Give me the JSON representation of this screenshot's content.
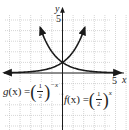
{
  "chart_data": {
    "type": "line",
    "title": "",
    "xlabel": "x",
    "ylabel": "y",
    "xlim": [
      -5,
      5
    ],
    "ylim": [
      -5,
      5
    ],
    "x_tick_labels": [
      "5"
    ],
    "y_tick_labels": [
      "5"
    ],
    "grid": true,
    "series": [
      {
        "name": "g(x) = (1/2)^(-x)",
        "formula": "2^x",
        "x": [
          -5,
          -4,
          -3,
          -2,
          -1,
          0,
          1,
          2
        ],
        "values": [
          0.03125,
          0.0625,
          0.125,
          0.25,
          0.5,
          1,
          2,
          4
        ]
      },
      {
        "name": "f(x) = (1/2)^x",
        "formula": "2^(-x)",
        "x": [
          -2,
          -1,
          0,
          1,
          2,
          3,
          4,
          5
        ],
        "values": [
          4,
          2,
          1,
          0.5,
          0.25,
          0.125,
          0.0625,
          0.03125
        ]
      }
    ],
    "annotations": [
      {
        "text": "g(x) = (1/2)^(-x)",
        "position": "lower-left"
      },
      {
        "text": "f(x) = (1/2)^x",
        "position": "lower-right"
      }
    ]
  },
  "labels": {
    "x_axis": "x",
    "y_axis": "y",
    "x_tick": "5",
    "y_tick": "5",
    "g_name": "g",
    "g_arg": "(x) =",
    "g_num": "1",
    "g_den": "2",
    "g_exp": "−x",
    "f_name": "f",
    "f_arg": "(x) =",
    "f_num": "1",
    "f_den": "2",
    "f_exp": "x"
  },
  "colors": {
    "curve": "#1a1a1a",
    "axis": "#1a1a1a",
    "grid": "#b8b8b8",
    "background": "#ffffff"
  }
}
